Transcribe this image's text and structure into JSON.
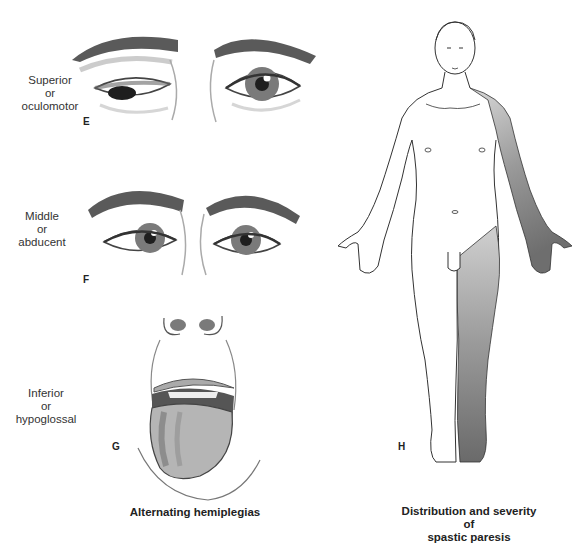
{
  "figure": {
    "panels": [
      {
        "letter": "E",
        "label_lines": [
          "Superior",
          "or",
          "oculomotor"
        ]
      },
      {
        "letter": "F",
        "label_lines": [
          "Middle",
          "or",
          "abducent"
        ]
      },
      {
        "letter": "G",
        "label_lines": [
          "Inferior",
          "or",
          "hypoglossal"
        ]
      },
      {
        "letter": "H"
      }
    ],
    "left_caption": "Alternating hemiplegias",
    "right_caption_lines": [
      "Distribution and severity",
      "of",
      "spastic paresis"
    ]
  },
  "colors": {
    "line": "#333333",
    "shade_light": "#c8c8c8",
    "shade_mid": "#9a9a9a",
    "shade_dark": "#6e6e6e",
    "iris": "#7a7a7a",
    "pupil": "#1e1e1e"
  }
}
